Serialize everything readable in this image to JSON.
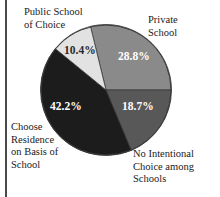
{
  "chart_data": {
    "type": "pie",
    "title": "",
    "subtitle": "",
    "xlabel": "",
    "ylabel": "",
    "legend_position": "none",
    "grid": false,
    "value_suffix": "%",
    "categories": [
      "Private School",
      "No Intentional Choice among Schools",
      "Choose Residence on Basis of School",
      "Public School of Choice"
    ],
    "values": [
      28.8,
      18.7,
      42.2,
      10.4
    ],
    "slices": [
      {
        "key": "private",
        "label": "Private School",
        "label_lines": [
          "Private",
          "School"
        ],
        "value": 28.8,
        "value_text": "28.8%",
        "color": "#8a8a8a",
        "value_text_color": "#ffffff",
        "start_angle": 256.3,
        "end_angle": 360.0
      },
      {
        "key": "no_intentional_choice",
        "label": "No Intentional Choice among Schools",
        "label_lines": [
          "No Intentional",
          "Choice among",
          "Schools"
        ],
        "value": 18.7,
        "value_text": "18.7%",
        "color": "#585858",
        "value_text_color": "#ffffff",
        "start_angle": 0.0,
        "end_angle": 67.3
      },
      {
        "key": "choose_residence",
        "label": "Choose Residence on Basis of School",
        "label_lines": [
          "Choose",
          "Residence",
          "on Basis of",
          "School"
        ],
        "value": 42.2,
        "value_text": "42.2%",
        "color": "#1c1c1c",
        "value_text_color": "#ffffff",
        "start_angle": 67.3,
        "end_angle": 219.2
      },
      {
        "key": "public_school_of_choice",
        "label": "Public School of Choice",
        "label_lines": [
          "Public School",
          "of Choice"
        ],
        "value": 10.4,
        "value_text": "10.4%",
        "color": "#e2e2e2",
        "value_text_color": "#2a2a2a",
        "start_angle": 219.2,
        "end_angle": 256.3
      }
    ],
    "background_color": "#ffffff",
    "outline_color": "#3a3a3a"
  },
  "labels": {
    "public_school_line1": "Public School",
    "public_school_line2": "of Choice",
    "private_line1": "Private",
    "private_line2": "School",
    "no_intentional_line1": "No Intentional",
    "no_intentional_line2": "Choice among",
    "no_intentional_line3": "Schools",
    "residence_line1": "Choose",
    "residence_line2": "Residence",
    "residence_line3": "on Basis of",
    "residence_line4": "School"
  },
  "values_text": {
    "private": "28.8%",
    "no_intentional": "18.7%",
    "residence": "42.2%",
    "public_school": "10.4%"
  }
}
